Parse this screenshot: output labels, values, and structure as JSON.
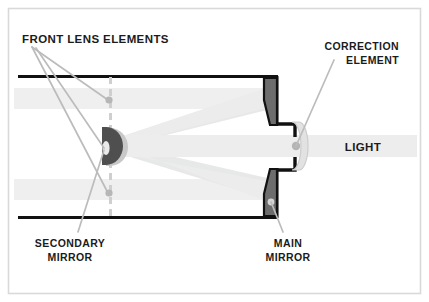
{
  "diagram": {
    "frame": {
      "border_color": "#d6d6d6",
      "background": "#ffffff"
    },
    "colors": {
      "outline": "#111111",
      "mirror_fill": "#6d6d6d",
      "secondary_mirror_fill": "#4a4a4a",
      "beam_light": "#efefef",
      "beam_mid": "#e6e7e7",
      "leader_line": "#b9b9b9",
      "dot": "#b0b0b0",
      "dashed_line": "#cfcfcf",
      "label_text": "#1b1b1b"
    },
    "labels": {
      "front_lens_elements": "FRONT LENS ELEMENTS",
      "correction_element_line1": "CORRECTION",
      "correction_element_line2": "ELEMENT",
      "light": "LIGHT",
      "secondary_mirror_line1": "SECONDARY",
      "secondary_mirror_line2": "MIRROR",
      "main_mirror_line1": "MAIN",
      "main_mirror_line2": "MIRROR"
    },
    "parts": [
      {
        "name": "front-lens-elements",
        "label": "FRONT LENS ELEMENTS"
      },
      {
        "name": "secondary-mirror",
        "label": "SECONDARY MIRROR"
      },
      {
        "name": "main-mirror",
        "label": "MAIN MIRROR"
      },
      {
        "name": "correction-element",
        "label": "CORRECTION ELEMENT"
      },
      {
        "name": "light",
        "label": "LIGHT"
      }
    ]
  }
}
